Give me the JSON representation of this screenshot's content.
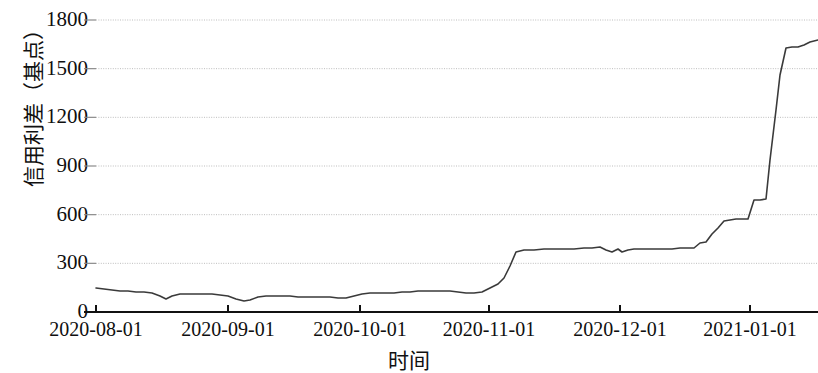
{
  "chart_data": {
    "type": "line",
    "title": "",
    "xlabel": "时间",
    "ylabel": "信用利差（基点）",
    "grid": true,
    "legend": false,
    "ylim": [
      0,
      1800
    ],
    "y_ticks": [
      0,
      300,
      600,
      900,
      1200,
      1500,
      1800
    ],
    "y_tick_labels": [
      "0",
      "300",
      "600",
      "900",
      "1200",
      "1500",
      "1800"
    ],
    "x_tick_labels": [
      "2020-08-01",
      "2020-09-01",
      "2020-10-01",
      "2020-11-01",
      "2020-12-01",
      "2021-01-01"
    ],
    "x_tick_dates": [
      "2020-08-01",
      "2020-09-01",
      "2020-10-01",
      "2020-11-01",
      "2020-12-01",
      "2021-01-01"
    ],
    "xlim": [
      "2020-07-27",
      "2021-01-29"
    ],
    "series": [
      {
        "name": "信用利差",
        "color": "#3a3a3a",
        "x": [
          "2020-07-27",
          "2020-07-30",
          "2020-08-03",
          "2020-08-06",
          "2020-08-10",
          "2020-08-13",
          "2020-08-17",
          "2020-08-20",
          "2020-08-24",
          "2020-08-27",
          "2020-08-31",
          "2020-09-03",
          "2020-09-07",
          "2020-09-10",
          "2020-09-14",
          "2020-09-17",
          "2020-09-21",
          "2020-09-24",
          "2020-09-28",
          "2020-10-01",
          "2020-10-06",
          "2020-10-09",
          "2020-10-13",
          "2020-10-16",
          "2020-10-20",
          "2020-10-23",
          "2020-10-27",
          "2020-10-30",
          "2020-11-02",
          "2020-11-04",
          "2020-11-06",
          "2020-11-09",
          "2020-11-11",
          "2020-11-13",
          "2020-11-16",
          "2020-11-18",
          "2020-11-20",
          "2020-11-24",
          "2020-11-27",
          "2020-12-01",
          "2020-12-04",
          "2020-12-08",
          "2020-12-11",
          "2020-12-15",
          "2020-12-18",
          "2020-12-22",
          "2020-12-25",
          "2020-12-29",
          "2021-01-01",
          "2021-01-04",
          "2021-01-06",
          "2021-01-08",
          "2021-01-11",
          "2021-01-13",
          "2021-01-15",
          "2021-01-18",
          "2021-01-20",
          "2021-01-22",
          "2021-01-25",
          "2021-01-27",
          "2021-01-29"
        ],
        "values": [
          192,
          190,
          188,
          186,
          184,
          183,
          181,
          170,
          176,
          178,
          178,
          178,
          178,
          176,
          162,
          158,
          168,
          172,
          172,
          172,
          170,
          168,
          166,
          166,
          178,
          180,
          180,
          182,
          184,
          190,
          196,
          198,
          200,
          196,
          178,
          186,
          214,
          232,
          372,
          378,
          382,
          384,
          386,
          382,
          366,
          372,
          358,
          370,
          372,
          374,
          374,
          376,
          376,
          378,
          382,
          392,
          500,
          520,
          620,
          690,
          692
        ]
      },
      {
        "name": "信用利差（续）",
        "color": "#3a3a3a",
        "x": [
          "2021-01-27",
          "2021-01-28",
          "2021-01-28",
          "2021-01-29",
          "2021-01-29",
          "2021-01-30"
        ],
        "values": [
          692,
          1100,
          1480,
          1570,
          1572,
          1655
        ]
      }
    ],
    "line_points_px": [
      [
        96,
        288
      ],
      [
        104,
        289
      ],
      [
        112,
        290
      ],
      [
        120,
        291
      ],
      [
        128,
        291
      ],
      [
        136,
        292
      ],
      [
        144,
        292
      ],
      [
        152,
        293
      ],
      [
        160,
        296
      ],
      [
        166,
        299
      ],
      [
        172,
        296
      ],
      [
        180,
        294
      ],
      [
        188,
        294
      ],
      [
        196,
        294
      ],
      [
        204,
        294
      ],
      [
        212,
        294
      ],
      [
        220,
        295
      ],
      [
        228,
        296
      ],
      [
        236,
        299
      ],
      [
        244,
        301
      ],
      [
        250,
        300
      ],
      [
        258,
        297
      ],
      [
        266,
        296
      ],
      [
        274,
        296
      ],
      [
        282,
        296
      ],
      [
        290,
        296
      ],
      [
        298,
        297
      ],
      [
        306,
        297
      ],
      [
        314,
        297
      ],
      [
        322,
        297
      ],
      [
        330,
        297
      ],
      [
        338,
        298
      ],
      [
        346,
        298
      ],
      [
        354,
        296
      ],
      [
        362,
        294
      ],
      [
        370,
        293
      ],
      [
        378,
        293
      ],
      [
        386,
        293
      ],
      [
        394,
        293
      ],
      [
        402,
        292
      ],
      [
        410,
        292
      ],
      [
        418,
        291
      ],
      [
        426,
        291
      ],
      [
        434,
        291
      ],
      [
        442,
        291
      ],
      [
        450,
        291
      ],
      [
        458,
        292
      ],
      [
        466,
        293
      ],
      [
        474,
        293
      ],
      [
        482,
        292
      ],
      [
        490,
        288
      ],
      [
        498,
        284
      ],
      [
        504,
        278
      ],
      [
        510,
        266
      ],
      [
        516,
        252
      ],
      [
        524,
        250
      ],
      [
        534,
        250
      ],
      [
        544,
        249
      ],
      [
        554,
        249
      ],
      [
        564,
        249
      ],
      [
        574,
        249
      ],
      [
        584,
        248
      ],
      [
        592,
        248
      ],
      [
        600,
        247
      ],
      [
        606,
        250
      ],
      [
        612,
        252
      ],
      [
        618,
        249
      ],
      [
        622,
        252
      ],
      [
        628,
        250
      ],
      [
        634,
        249
      ],
      [
        640,
        249
      ],
      [
        648,
        249
      ],
      [
        656,
        249
      ],
      [
        664,
        249
      ],
      [
        672,
        249
      ],
      [
        680,
        248
      ],
      [
        688,
        248
      ],
      [
        694,
        248
      ],
      [
        700,
        243
      ],
      [
        706,
        242
      ],
      [
        712,
        234
      ],
      [
        718,
        228
      ],
      [
        724,
        221
      ],
      [
        730,
        220
      ],
      [
        736,
        219
      ],
      [
        742,
        219
      ],
      [
        748,
        219
      ],
      [
        754,
        200
      ],
      [
        760,
        200
      ],
      [
        766,
        199
      ],
      [
        770,
        160
      ],
      [
        776,
        110
      ],
      [
        780,
        75
      ],
      [
        786,
        48
      ],
      [
        792,
        47
      ],
      [
        798,
        47
      ],
      [
        804,
        45
      ],
      [
        810,
        42
      ],
      [
        818,
        40
      ]
    ],
    "plot_geometry": {
      "left_px": 96,
      "right_px": 818,
      "top_px": 20,
      "bottom_px": 312,
      "x_tick_px": [
        96,
        228,
        360,
        489,
        620,
        750
      ]
    },
    "style": {
      "line_color": "#3a3a3a",
      "line_width_px": 1.6,
      "grid_color": "#bdbdbd",
      "grid_dash": "1,1.4",
      "axis_color": "#111111",
      "background": "#ffffff"
    }
  }
}
